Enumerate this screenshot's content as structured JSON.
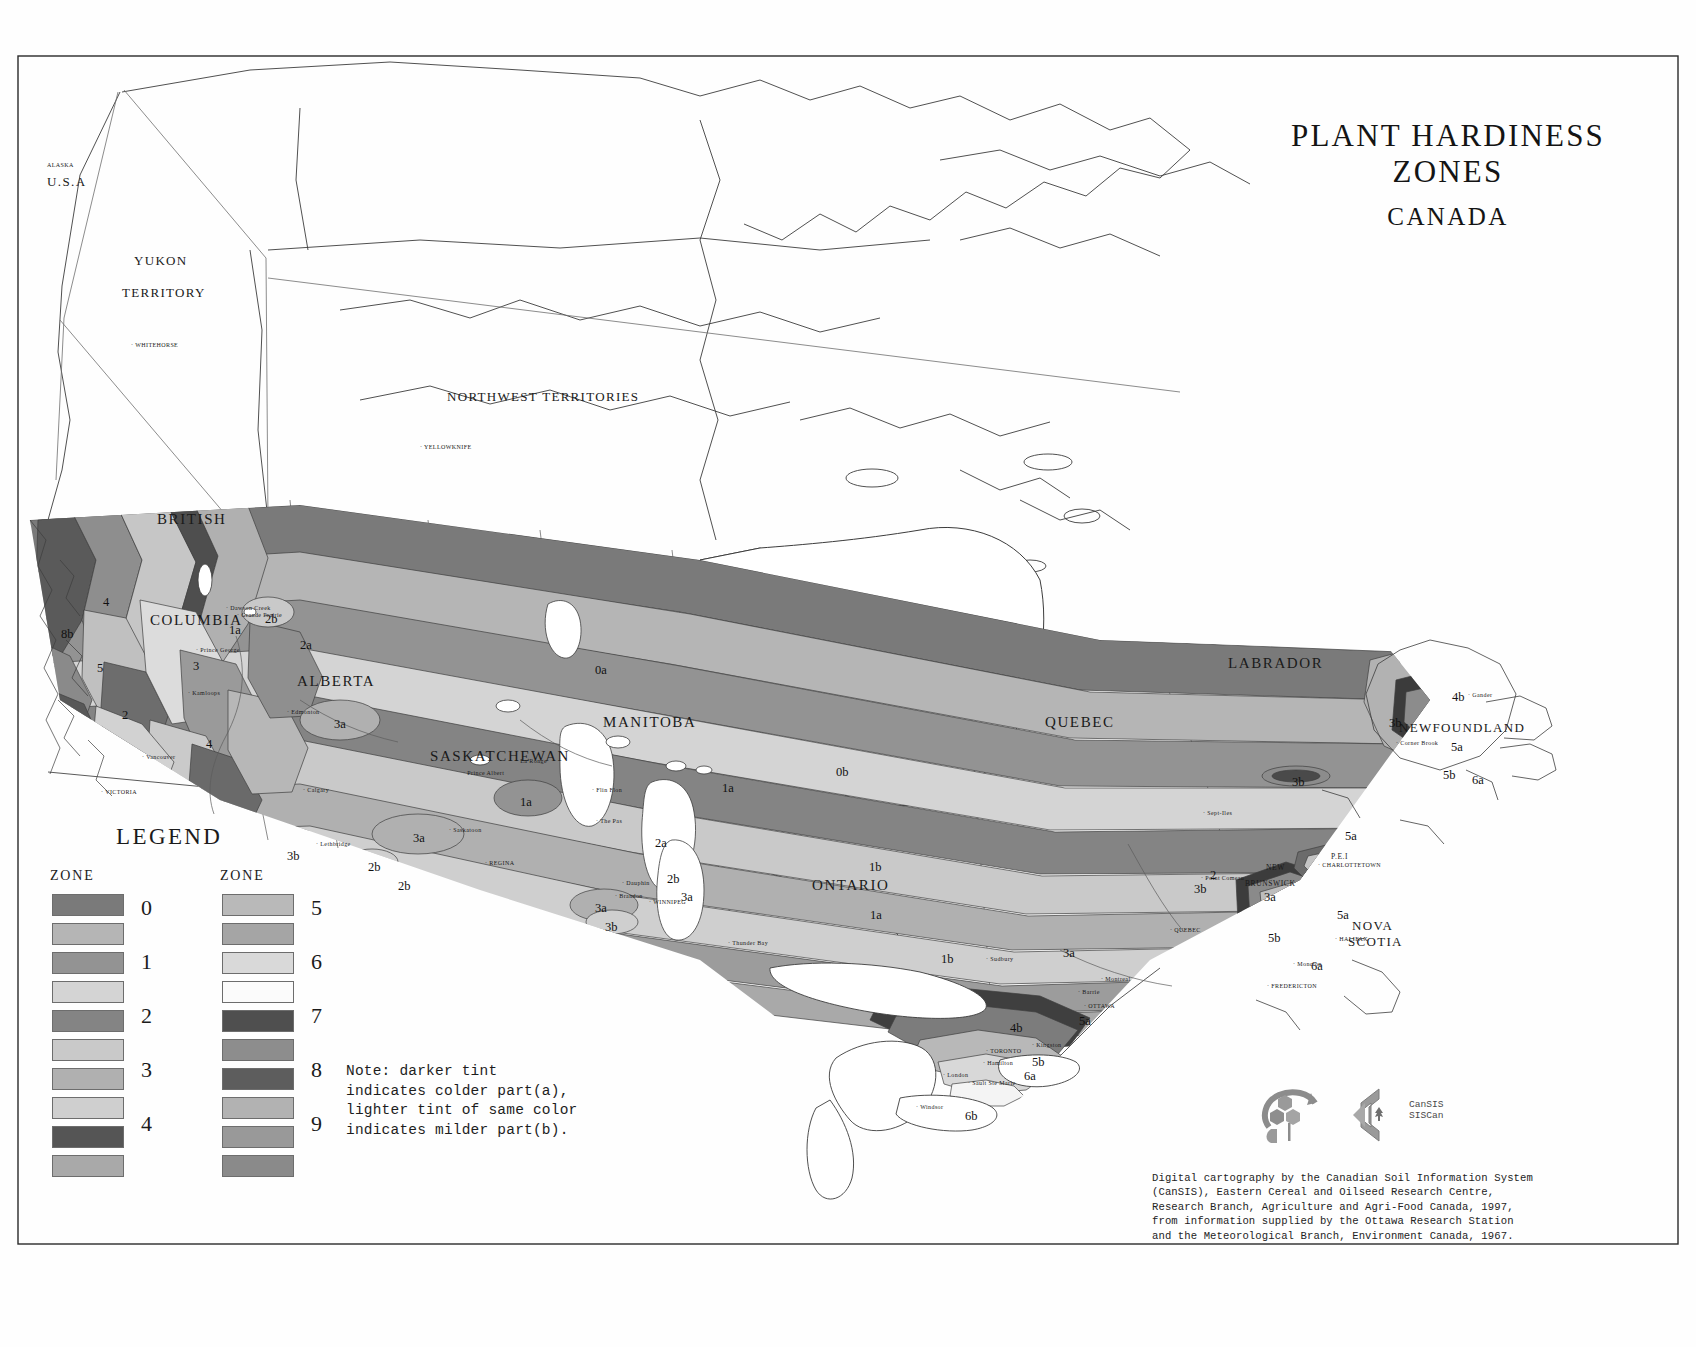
{
  "title": {
    "main": "PLANT HARDINESS ZONES",
    "sub": "CANADA"
  },
  "legend": {
    "heading": "LEGEND",
    "zone_header_left": "ZONE",
    "zone_header_right": "ZONE",
    "numbers_left": [
      "0",
      "1",
      "2",
      "3",
      "4"
    ],
    "numbers_right": [
      "5",
      "6",
      "7",
      "8",
      "9"
    ],
    "note": "Note: darker tint\nindicates colder part(a),\nlighter tint of same color\nindicates milder part(b).",
    "swatches_left": [
      {
        "zone": "0a",
        "color": "#7a7a7a"
      },
      {
        "zone": "0b",
        "color": "#b5b5b5"
      },
      {
        "zone": "1a",
        "color": "#939393"
      },
      {
        "zone": "1b",
        "color": "#d4d4d4"
      },
      {
        "zone": "2a",
        "color": "#848484"
      },
      {
        "zone": "2b",
        "color": "#c9c9c9"
      },
      {
        "zone": "3a",
        "color": "#b0b0b0"
      },
      {
        "zone": "3b",
        "color": "#cfcfcf"
      },
      {
        "zone": "4a",
        "color": "#555555"
      },
      {
        "zone": "4b",
        "color": "#a9a9a9"
      }
    ],
    "swatches_right": [
      {
        "zone": "5a",
        "color": "#b9b9b9"
      },
      {
        "zone": "5b",
        "color": "#a5a5a5"
      },
      {
        "zone": "6a",
        "color": "#d9d9d9"
      },
      {
        "zone": "6b",
        "color": "#fbfbfb"
      },
      {
        "zone": "7a",
        "color": "#4f4f4f"
      },
      {
        "zone": "7b",
        "color": "#8d8d8d"
      },
      {
        "zone": "8a",
        "color": "#5d5d5d"
      },
      {
        "zone": "8b",
        "color": "#b2b2b2"
      },
      {
        "zone": "9a",
        "color": "#999999"
      },
      {
        "zone": "9b",
        "color": "#8a8a8a"
      }
    ]
  },
  "credits": "Digital cartography by the Canadian Soil Information System\n(CanSIS), Eastern Cereal and Oilseed Research Centre,\nResearch Branch, Agriculture and Agri-Food Canada, 1997,\nfrom information supplied by the Ottawa Research Station\nand the Meteorological Branch, Environment Canada, 1967.",
  "cansis_logo_text": "CanSIS\nSISCan",
  "regions": [
    {
      "name": "ALASKA",
      "x": 47,
      "y": 162,
      "cls": "country tinier"
    },
    {
      "name": "U.S.A",
      "x": 47,
      "y": 174,
      "cls": "country"
    },
    {
      "name": "YUKON",
      "x": 134,
      "y": 253,
      "cls": "prov-sm"
    },
    {
      "name": "TERRITORY",
      "x": 122,
      "y": 285,
      "cls": "prov-sm"
    },
    {
      "name": "NORTHWEST  TERRITORIES",
      "x": 447,
      "y": 389,
      "cls": "prov-sm"
    },
    {
      "name": "BRITISH",
      "x": 157,
      "y": 511,
      "cls": "prov"
    },
    {
      "name": "COLUMBIA",
      "x": 150,
      "y": 612,
      "cls": "prov"
    },
    {
      "name": "ALBERTA",
      "x": 297,
      "y": 673,
      "cls": "prov"
    },
    {
      "name": "SASKATCHEWAN",
      "x": 430,
      "y": 748,
      "cls": "prov"
    },
    {
      "name": "MANITOBA",
      "x": 603,
      "y": 714,
      "cls": "prov"
    },
    {
      "name": "ONTARIO",
      "x": 812,
      "y": 877,
      "cls": "prov"
    },
    {
      "name": "QUEBEC",
      "x": 1045,
      "y": 714,
      "cls": "prov"
    },
    {
      "name": "LABRADOR",
      "x": 1228,
      "y": 655,
      "cls": "prov"
    },
    {
      "name": "NEWFOUNDLAND",
      "x": 1399,
      "y": 720,
      "cls": "prov-sm"
    },
    {
      "name": "NEW",
      "x": 1266,
      "y": 863,
      "cls": "tiny"
    },
    {
      "name": "BRUNSWICK",
      "x": 1245,
      "y": 879,
      "cls": "tiny"
    },
    {
      "name": "NOVA",
      "x": 1352,
      "y": 918,
      "cls": "prov-sm"
    },
    {
      "name": "SCOTIA",
      "x": 1348,
      "y": 934,
      "cls": "prov-sm"
    },
    {
      "name": "P.E.I",
      "x": 1331,
      "y": 852,
      "cls": "tiny"
    }
  ],
  "cities": [
    {
      "name": "WHITEHORSE",
      "x": 131,
      "y": 342
    },
    {
      "name": "YELLOWKNIFE",
      "x": 420,
      "y": 444
    },
    {
      "name": "VICTORIA",
      "x": 101,
      "y": 789
    },
    {
      "name": "Calgary",
      "x": 303,
      "y": 787
    },
    {
      "name": "Lethbridge",
      "x": 316,
      "y": 841
    },
    {
      "name": "REGINA",
      "x": 485,
      "y": 860
    },
    {
      "name": "Saskatoon",
      "x": 449,
      "y": 827
    },
    {
      "name": "Prince Albert",
      "x": 463,
      "y": 770
    },
    {
      "name": "Brandon",
      "x": 615,
      "y": 893
    },
    {
      "name": "WINNIPEG",
      "x": 649,
      "y": 899
    },
    {
      "name": "Thunder Bay",
      "x": 728,
      "y": 940
    },
    {
      "name": "Sudbury",
      "x": 986,
      "y": 956
    },
    {
      "name": "OTTAWA",
      "x": 1084,
      "y": 1003
    },
    {
      "name": "TORONTO",
      "x": 986,
      "y": 1048
    },
    {
      "name": "Kingston",
      "x": 1032,
      "y": 1042
    },
    {
      "name": "Hamilton",
      "x": 983,
      "y": 1060
    },
    {
      "name": "London",
      "x": 943,
      "y": 1072
    },
    {
      "name": "Windsor",
      "x": 916,
      "y": 1104
    },
    {
      "name": "QUEBEC",
      "x": 1170,
      "y": 927
    },
    {
      "name": "Montreal",
      "x": 1101,
      "y": 976
    },
    {
      "name": "CHARLOTTETOWN",
      "x": 1318,
      "y": 862
    },
    {
      "name": "HALIFAX",
      "x": 1335,
      "y": 936
    },
    {
      "name": "FREDERICTON",
      "x": 1267,
      "y": 983
    },
    {
      "name": "Corner Brook",
      "x": 1396,
      "y": 740
    },
    {
      "name": "Gander",
      "x": 1468,
      "y": 692
    },
    {
      "name": "Grande Prairie",
      "x": 237,
      "y": 612
    },
    {
      "name": "Dawson Creek",
      "x": 226,
      "y": 605
    },
    {
      "name": "Kamloops",
      "x": 188,
      "y": 690
    },
    {
      "name": "Prince George",
      "x": 196,
      "y": 647
    },
    {
      "name": "Vancouver",
      "x": 142,
      "y": 754
    },
    {
      "name": "Edmonton",
      "x": 287,
      "y": 709
    },
    {
      "name": "La Ronge",
      "x": 516,
      "y": 758
    },
    {
      "name": "Flin Flon",
      "x": 592,
      "y": 787
    },
    {
      "name": "The Pas",
      "x": 596,
      "y": 818
    },
    {
      "name": "Dauphin",
      "x": 622,
      "y": 880
    },
    {
      "name": "Sept-Iles",
      "x": 1203,
      "y": 810
    },
    {
      "name": "Point Comeau",
      "x": 1201,
      "y": 875
    },
    {
      "name": "Moncton",
      "x": 1293,
      "y": 961
    },
    {
      "name": "Sault Ste Marie",
      "x": 968,
      "y": 1080
    },
    {
      "name": "Barrie",
      "x": 1078,
      "y": 989
    }
  ],
  "zone_labels": [
    {
      "t": "0a",
      "x": 595,
      "y": 663
    },
    {
      "t": "0b",
      "x": 836,
      "y": 765
    },
    {
      "t": "1a",
      "x": 229,
      "y": 623
    },
    {
      "t": "1a",
      "x": 520,
      "y": 795
    },
    {
      "t": "1a",
      "x": 722,
      "y": 781
    },
    {
      "t": "1a",
      "x": 870,
      "y": 908
    },
    {
      "t": "1b",
      "x": 869,
      "y": 860
    },
    {
      "t": "1b",
      "x": 941,
      "y": 952
    },
    {
      "t": "2a",
      "x": 300,
      "y": 638
    },
    {
      "t": "2a",
      "x": 655,
      "y": 836
    },
    {
      "t": "2b",
      "x": 265,
      "y": 612
    },
    {
      "t": "2b",
      "x": 368,
      "y": 860
    },
    {
      "t": "2b",
      "x": 398,
      "y": 879
    },
    {
      "t": "2b",
      "x": 667,
      "y": 872
    },
    {
      "t": "3",
      "x": 193,
      "y": 659
    },
    {
      "t": "3a",
      "x": 334,
      "y": 717
    },
    {
      "t": "3a",
      "x": 413,
      "y": 831
    },
    {
      "t": "3a",
      "x": 595,
      "y": 901
    },
    {
      "t": "3a",
      "x": 681,
      "y": 890
    },
    {
      "t": "3a",
      "x": 1063,
      "y": 946
    },
    {
      "t": "3a",
      "x": 1264,
      "y": 890
    },
    {
      "t": "3b",
      "x": 287,
      "y": 849
    },
    {
      "t": "3b",
      "x": 605,
      "y": 920
    },
    {
      "t": "3b",
      "x": 1292,
      "y": 775
    },
    {
      "t": "3b",
      "x": 1389,
      "y": 716
    },
    {
      "t": "3b",
      "x": 1194,
      "y": 882
    },
    {
      "t": "4",
      "x": 103,
      "y": 595
    },
    {
      "t": "4",
      "x": 206,
      "y": 737
    },
    {
      "t": "4b",
      "x": 1010,
      "y": 1021
    },
    {
      "t": "4b",
      "x": 1452,
      "y": 690
    },
    {
      "t": "5",
      "x": 97,
      "y": 661
    },
    {
      "t": "5a",
      "x": 1079,
      "y": 1014
    },
    {
      "t": "5a",
      "x": 1345,
      "y": 829
    },
    {
      "t": "5a",
      "x": 1337,
      "y": 908
    },
    {
      "t": "5a",
      "x": 1451,
      "y": 740
    },
    {
      "t": "5b",
      "x": 1032,
      "y": 1055
    },
    {
      "t": "5b",
      "x": 1268,
      "y": 931
    },
    {
      "t": "5b",
      "x": 1443,
      "y": 768
    },
    {
      "t": "6a",
      "x": 1024,
      "y": 1069
    },
    {
      "t": "6a",
      "x": 1311,
      "y": 959
    },
    {
      "t": "6b",
      "x": 965,
      "y": 1109
    },
    {
      "t": "6a",
      "x": 1472,
      "y": 773
    },
    {
      "t": "8b",
      "x": 61,
      "y": 627
    },
    {
      "t": "2",
      "x": 1210,
      "y": 868
    },
    {
      "t": "2",
      "x": 122,
      "y": 708
    }
  ]
}
